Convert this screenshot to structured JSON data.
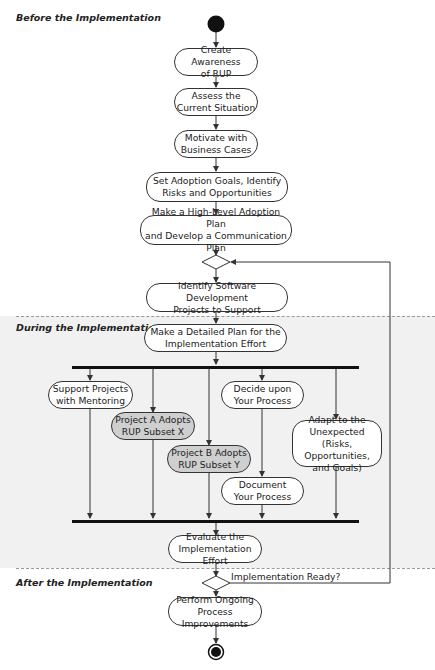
{
  "phases": {
    "before": "Before the Implementation",
    "during": "During the Implementation",
    "after": "After the Implementation"
  },
  "nodes": {
    "create_awareness": "Create Awareness\nof RUP",
    "assess": "Assess the\nCurrent Situation",
    "motivate": "Motivate with\nBusiness Cases",
    "set_goals": "Set Adoption Goals, Identify\nRisks and Opportunities",
    "high_level_plan": "Make a High-Level Adoption Plan\nand Develop a Communication Plan",
    "identify_projects": "Identify Software Development\nProjects to Support",
    "detailed_plan": "Make a Detailed Plan for the\nImplementation Effort",
    "support_projects": "Support Projects\nwith Mentoring",
    "project_a": "Project A Adopts\nRUP Subset X",
    "project_b": "Project B Adopts\nRUP Subset Y",
    "decide_process": "Decide upon\nYour Process",
    "document_process": "Document\nYour Process",
    "adapt": "Adapt to the\nUnexpected\n(Risks, Opportunities,\nand Goals)",
    "evaluate": "Evaluate the\nImplementation Effort",
    "ongoing": "Perform Ongoing\nProcess Improvements"
  },
  "decision_label": "Implementation Ready?",
  "colors": {
    "line": "#333333",
    "band": "#f1f1f1",
    "highlight_node": "#cfcfcf"
  }
}
